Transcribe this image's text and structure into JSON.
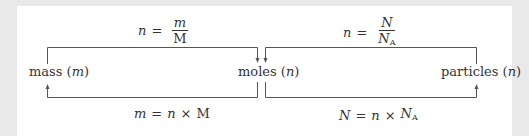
{
  "diagram": {
    "nodes": {
      "mass": {
        "label": "mass",
        "symbol": "m"
      },
      "moles": {
        "label": "moles",
        "symbol": "n"
      },
      "particles": {
        "label": "particles",
        "symbol": "n"
      }
    },
    "formulas": {
      "mass_to_moles": {
        "lhs": "n",
        "eq": "=",
        "numerator": "m",
        "denominator": "M"
      },
      "moles_to_mass": {
        "lhs": "m",
        "eq": "=",
        "a": "n",
        "op": "×",
        "b": "M"
      },
      "particles_to_moles": {
        "lhs": "n",
        "eq": "=",
        "numerator": "N",
        "denominator": "N",
        "denominator_sub": "A"
      },
      "moles_to_particles": {
        "lhs": "N",
        "eq": "=",
        "a": "n",
        "op": "×",
        "b": "N",
        "b_sub": "A"
      }
    },
    "arrows": [
      {
        "from": "mass",
        "to": "moles",
        "via": "top",
        "formula": "mass_to_moles"
      },
      {
        "from": "moles",
        "to": "mass",
        "via": "bottom",
        "formula": "moles_to_mass"
      },
      {
        "from": "particles",
        "to": "moles",
        "via": "top",
        "formula": "particles_to_moles"
      },
      {
        "from": "moles",
        "to": "particles",
        "via": "bottom",
        "formula": "moles_to_particles"
      }
    ],
    "colors": {
      "line": "#555555",
      "text": "#333333",
      "background": "#ffffff",
      "frame": "#e9e9e9"
    }
  }
}
